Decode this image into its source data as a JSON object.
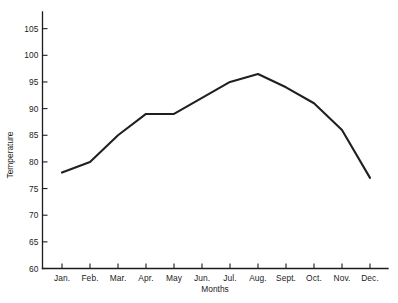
{
  "chart_data": {
    "type": "line",
    "title": "",
    "xlabel": "Months",
    "ylabel": "Temperature",
    "categories": [
      "Jan.",
      "Feb.",
      "Mar.",
      "Apr.",
      "May",
      "Jun.",
      "Jul.",
      "Aug.",
      "Sept.",
      "Oct.",
      "Nov.",
      "Dec."
    ],
    "values": [
      78,
      80,
      85,
      89,
      89,
      92,
      95,
      96.5,
      94,
      91,
      86,
      77
    ],
    "series": [
      {
        "name": "Temperature",
        "values": [
          78,
          80,
          85,
          89,
          89,
          92,
          95,
          96.5,
          94,
          91,
          86,
          77
        ]
      }
    ],
    "ylim": [
      60,
      107
    ],
    "yticks": [
      60,
      65,
      70,
      75,
      80,
      85,
      90,
      95,
      100,
      105
    ],
    "ytick_labels": [
      "60",
      "65",
      "70",
      "75",
      "80",
      "85",
      "90",
      "95",
      "100",
      "105"
    ],
    "xtick_labels": [
      "Jan.",
      "Feb.",
      "Mar.",
      "Apr.",
      "May",
      "Jun.",
      "Jul.",
      "Aug.",
      "Sept.",
      "Oct.",
      "Nov.",
      "Dec."
    ],
    "grid": false,
    "legend": false,
    "legend_position": "none",
    "line_color": "#231f20",
    "axis_color": "#1c1c1c",
    "background": "#ffffff",
    "marker": "none"
  }
}
